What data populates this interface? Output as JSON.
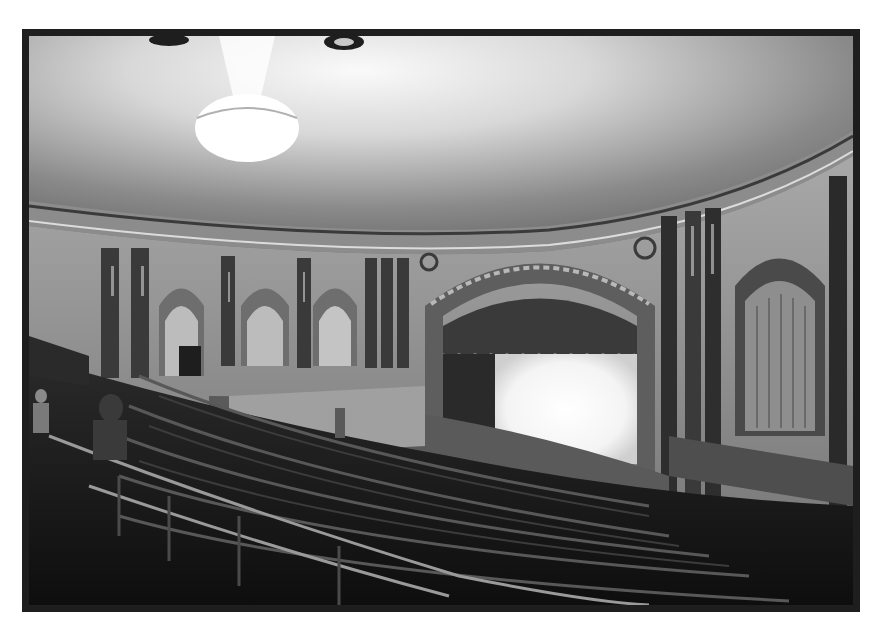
{
  "image": {
    "subject": "Black-and-white photograph of a historic theater auditorium viewed from the balcony",
    "frame_color": "#1e1e1e",
    "background_color": "#ffffff",
    "elements": [
      "domed ceiling with chandelier",
      "ornate cornice molding",
      "columns with arched curtained niches",
      "proscenium arch with decorative relief",
      "brightly lit stage",
      "curved rows of balcony seating",
      "metal railings",
      "people standing in aisles"
    ]
  },
  "palette": {
    "ceiling_light": "#f2f2f2",
    "ceiling_mid": "#b8b8b8",
    "wall": "#9a9a9a",
    "column": "#3a3a3a",
    "stage_light": "#ffffff",
    "seats": "#1a1a1a"
  }
}
